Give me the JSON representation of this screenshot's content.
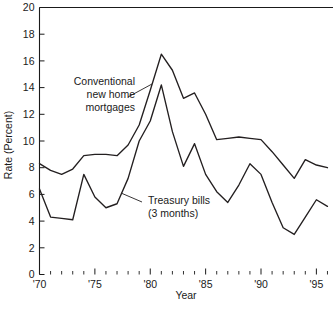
{
  "chart_data": {
    "type": "line",
    "title": "",
    "subtitle": "",
    "xlabel": "Year",
    "ylabel": "Rate (Percent)",
    "xlim": [
      1970,
      1996.5
    ],
    "ylim": [
      0,
      20
    ],
    "grid": false,
    "legend_position": "inline-annotations",
    "y_ticks": [
      0,
      2,
      4,
      6,
      8,
      10,
      12,
      14,
      16,
      18,
      20
    ],
    "y_tick_labels": [
      "0",
      "2",
      "4",
      "6",
      "8",
      "10",
      "12",
      "14",
      "16",
      "18",
      "20"
    ],
    "x_ticks": [
      1970,
      1975,
      1980,
      1985,
      1990,
      1995
    ],
    "x_tick_labels": [
      "'70",
      "'75",
      "'80",
      "'85",
      "'90",
      "'95"
    ],
    "x_minor_ticks": [
      1971,
      1972,
      1973,
      1974,
      1976,
      1977,
      1978,
      1979,
      1981,
      1982,
      1983,
      1984,
      1986,
      1987,
      1988,
      1989,
      1991,
      1992,
      1993,
      1994,
      1996
    ],
    "x": [
      1970,
      1971,
      1972,
      1973,
      1974,
      1975,
      1976,
      1977,
      1978,
      1979,
      1980,
      1981,
      1982,
      1983,
      1984,
      1985,
      1986,
      1987,
      1988,
      1989,
      1990,
      1991,
      1992,
      1993,
      1994,
      1995,
      1996
    ],
    "series": [
      {
        "name": "Conventional new home mortgages",
        "color": "#231f20",
        "values": [
          8.3,
          7.8,
          7.5,
          7.9,
          8.9,
          9.0,
          9.0,
          8.9,
          9.7,
          11.2,
          13.8,
          16.5,
          15.3,
          13.2,
          13.6,
          12.0,
          10.1,
          10.2,
          10.3,
          10.2,
          10.1,
          9.2,
          8.2,
          7.2,
          8.6,
          8.2,
          8.0
        ]
      },
      {
        "name": "Treasury bills (3 months)",
        "color": "#231f20",
        "values": [
          6.4,
          4.3,
          4.2,
          4.1,
          7.5,
          5.8,
          5.0,
          5.3,
          7.2,
          10.0,
          11.5,
          14.2,
          10.7,
          8.1,
          9.8,
          7.5,
          6.2,
          5.4,
          6.7,
          8.3,
          7.5,
          5.4,
          3.5,
          3.0,
          4.3,
          5.6,
          5.1
        ]
      }
    ],
    "annotations": [
      {
        "id": "mortgages",
        "lines": [
          "Conventional",
          "new home",
          "mortgages"
        ],
        "leader_from": [
          128,
          97
        ],
        "leader_to": [
          152,
          84
        ]
      },
      {
        "id": "treasury",
        "lines": [
          "Treasury bills",
          "(3 months)"
        ],
        "leader_from": [
          142,
          202
        ],
        "leader_to": [
          121,
          193
        ]
      }
    ]
  },
  "accessibility": {
    "chart_description": "Line chart of conventional new home mortgage rates and three-month Treasury bill rates from 1970 to 1996"
  }
}
